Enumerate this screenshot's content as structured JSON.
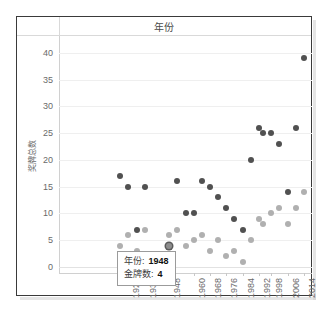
{
  "header": {
    "title": "年份"
  },
  "tooltip": {
    "year_label": "年份:",
    "year_value": "1948",
    "medal_label": "金牌数:",
    "medal_value": "4"
  },
  "chart_data": {
    "type": "scatter",
    "title": "年份",
    "xlabel": "",
    "ylabel": "奖牌总数",
    "xlim": [
      1894,
      2018
    ],
    "ylim": [
      0,
      42
    ],
    "grid": true,
    "legend": "none",
    "y_ticks": [
      0,
      5,
      10,
      15,
      20,
      25,
      30,
      35,
      40
    ],
    "x_ticks": [
      1928,
      1936,
      1948,
      1960,
      1968,
      1976,
      1984,
      1992,
      1998,
      2006,
      2014
    ],
    "colors": {
      "series_1": "#515151",
      "series_2": "#b0b0b0",
      "selected": "#5a5a5a"
    },
    "selected_point": {
      "x": 1948,
      "y": 4
    },
    "series": [
      {
        "name": "金牌数",
        "color": "#515151",
        "points": [
          {
            "x": 1924,
            "y": 17
          },
          {
            "x": 1928,
            "y": 15
          },
          {
            "x": 1932,
            "y": 7
          },
          {
            "x": 1936,
            "y": 15
          },
          {
            "x": 1948,
            "y": 4
          },
          {
            "x": 1952,
            "y": 16
          },
          {
            "x": 1956,
            "y": 10
          },
          {
            "x": 1960,
            "y": 10
          },
          {
            "x": 1964,
            "y": 16
          },
          {
            "x": 1968,
            "y": 15
          },
          {
            "x": 1972,
            "y": 13
          },
          {
            "x": 1976,
            "y": 11
          },
          {
            "x": 1980,
            "y": 9
          },
          {
            "x": 1984,
            "y": 7
          },
          {
            "x": 1988,
            "y": 20
          },
          {
            "x": 1992,
            "y": 26
          },
          {
            "x": 1994,
            "y": 25
          },
          {
            "x": 1998,
            "y": 25
          },
          {
            "x": 2002,
            "y": 23
          },
          {
            "x": 2006,
            "y": 14
          },
          {
            "x": 2010,
            "y": 26
          },
          {
            "x": 2014,
            "y": 39
          }
        ]
      },
      {
        "name": "其他",
        "color": "#b0b0b0",
        "points": [
          {
            "x": 1924,
            "y": 4
          },
          {
            "x": 1928,
            "y": 6
          },
          {
            "x": 1932,
            "y": 3
          },
          {
            "x": 1936,
            "y": 7
          },
          {
            "x": 1948,
            "y": 6
          },
          {
            "x": 1952,
            "y": 7
          },
          {
            "x": 1956,
            "y": 4
          },
          {
            "x": 1960,
            "y": 5
          },
          {
            "x": 1964,
            "y": 6
          },
          {
            "x": 1968,
            "y": 3
          },
          {
            "x": 1972,
            "y": 5
          },
          {
            "x": 1976,
            "y": 2
          },
          {
            "x": 1980,
            "y": 3
          },
          {
            "x": 1984,
            "y": 1
          },
          {
            "x": 1988,
            "y": 5
          },
          {
            "x": 1992,
            "y": 9
          },
          {
            "x": 1994,
            "y": 8
          },
          {
            "x": 1998,
            "y": 10
          },
          {
            "x": 2002,
            "y": 11
          },
          {
            "x": 2006,
            "y": 8
          },
          {
            "x": 2010,
            "y": 11
          },
          {
            "x": 2014,
            "y": 14
          }
        ]
      }
    ]
  }
}
